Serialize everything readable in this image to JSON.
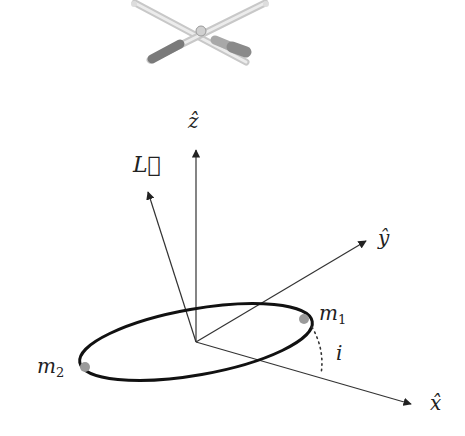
{
  "diagram": {
    "axes": [
      {
        "id": "z",
        "label": "ẑ"
      },
      {
        "id": "y",
        "label": "ŷ"
      },
      {
        "id": "x",
        "label": "x̂"
      }
    ],
    "angular_momentum": {
      "label": "L⃗"
    },
    "masses": [
      {
        "id": "m1",
        "label": "m",
        "subscript": "1"
      },
      {
        "id": "m2",
        "label": "m",
        "subscript": "2"
      }
    ],
    "inclination": {
      "label": "i"
    },
    "colors": {
      "axis": "#333333",
      "orbit": "#111111",
      "mass": "#9a9a9a",
      "satellite": "#b8b8b8"
    },
    "satellite_icon": "interferometer-icon"
  }
}
